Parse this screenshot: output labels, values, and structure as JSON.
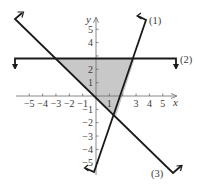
{
  "chart_data": {
    "type": "line",
    "title": "",
    "xlabel": "x",
    "ylabel": "y",
    "xlim": [
      -6,
      6
    ],
    "ylim": [
      -6,
      6
    ],
    "grid": false,
    "x_ticks": [
      -5,
      -4,
      -3,
      -2,
      -1,
      1,
      3,
      4,
      5
    ],
    "x_tick_labels": [
      "−5",
      "−4",
      "−3",
      "−2",
      "−1",
      "1",
      "3",
      "4",
      "5"
    ],
    "y_ticks": [
      5,
      4,
      2,
      1,
      -1,
      -2,
      -3,
      -4,
      -5
    ],
    "y_tick_labels": [
      "5",
      "4",
      "2",
      "1",
      "−1",
      "−2",
      "−3",
      "−4",
      "−5"
    ],
    "series": [
      {
        "name": "(1)",
        "equation": "y = 3x - 6",
        "points": [
          [
            -0.15,
            -6.45
          ],
          [
            3.76,
            5.28
          ]
        ]
      },
      {
        "name": "(2)",
        "equation": "y = 3",
        "points": [
          [
            -6.1,
            3
          ],
          [
            6.0,
            3
          ]
        ]
      },
      {
        "name": "(3)",
        "equation": "y = -x",
        "points": [
          [
            -6.1,
            6.1
          ],
          [
            5.8,
            -5.8
          ]
        ]
      }
    ],
    "shaded_region": {
      "description": "feasible triangle bounded by lines (1), (2), (3)",
      "vertices": [
        [
          -3,
          3
        ],
        [
          3,
          3
        ],
        [
          1.5,
          -1.5
        ]
      ],
      "fill": "#c8c8c8"
    },
    "annotations": [
      "(1)",
      "(2)",
      "(3)"
    ]
  },
  "labels": {
    "x_axis": "x",
    "y_axis": "y",
    "line1": "(1)",
    "line2": "(2)",
    "line3": "(3)"
  },
  "colors": {
    "line": "#1a1a1a",
    "axis": "#6a6a6a",
    "shade": "#c8c8c8",
    "text": "#3a3a3a"
  }
}
